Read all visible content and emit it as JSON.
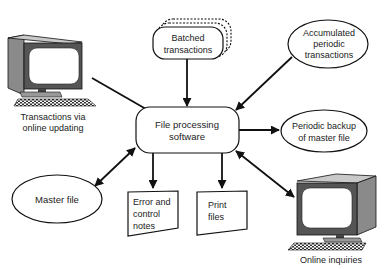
{
  "diagram": {
    "center": {
      "label_lines": [
        "File processing",
        "software"
      ]
    },
    "nodes": {
      "online_updating": {
        "label_lines": [
          "Transactions via",
          "online updating"
        ],
        "icon": "computer-terminal-icon"
      },
      "batched": {
        "label_lines": [
          "Batched",
          "transactions"
        ]
      },
      "accumulated": {
        "label_lines": [
          "Accumulated",
          "periodic",
          "transactions"
        ]
      },
      "backup": {
        "label_lines": [
          "Periodic backup",
          "of master file"
        ]
      },
      "master": {
        "label_lines": [
          "Master file"
        ]
      },
      "error_notes": {
        "label_lines": [
          "Error and",
          "control",
          "notes"
        ]
      },
      "print_files": {
        "label_lines": [
          "Print",
          "files"
        ]
      },
      "online_inquiries": {
        "label_lines": [
          "Online inquiries"
        ],
        "icon": "computer-terminal-icon"
      }
    },
    "edges": [
      {
        "from": "online_updating",
        "to": "center",
        "direction": "to-center"
      },
      {
        "from": "batched",
        "to": "center",
        "direction": "to-center"
      },
      {
        "from": "accumulated",
        "to": "center",
        "direction": "to-center"
      },
      {
        "from": "center",
        "to": "backup",
        "direction": "from-center"
      },
      {
        "from": "master",
        "to": "center",
        "direction": "bidirectional"
      },
      {
        "from": "center",
        "to": "error_notes",
        "direction": "from-center"
      },
      {
        "from": "center",
        "to": "print_files",
        "direction": "from-center"
      },
      {
        "from": "center",
        "to": "online_inquiries",
        "direction": "bidirectional"
      }
    ]
  }
}
